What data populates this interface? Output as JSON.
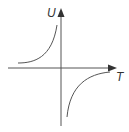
{
  "diagram": {
    "title": "",
    "y_axis_label": "U",
    "x_axis_label": "T",
    "curve_type": "hyperbola",
    "colors": {
      "axis": "#555555",
      "curve": "#555555",
      "label": "#333333"
    }
  }
}
